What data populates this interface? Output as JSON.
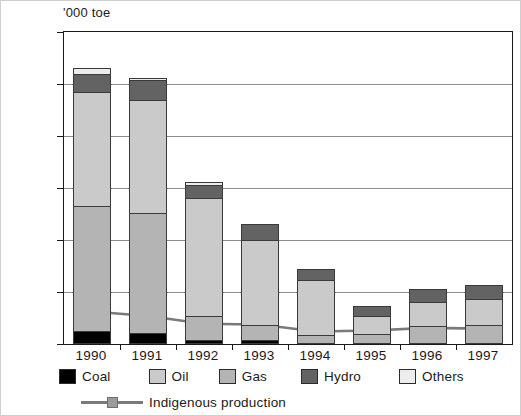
{
  "axis": {
    "unit_label": "'000 toe",
    "y_ticks": [
      "0",
      "2 000",
      "4 000",
      "6 000",
      "8 000",
      "10 000",
      "12 000"
    ]
  },
  "legend": {
    "items": [
      {
        "label": "Coal",
        "color": "#000000"
      },
      {
        "label": "Oil",
        "color": "#cacaca"
      },
      {
        "label": "Gas",
        "color": "#b4b4b4"
      },
      {
        "label": "Hydro",
        "color": "#636363"
      },
      {
        "label": "Others",
        "color": "#ededed"
      }
    ],
    "line_series_label": "Indigenous production",
    "line_color": "#7a7a7a",
    "marker_color": "#9b9b9b"
  },
  "chart_data": {
    "type": "bar",
    "subtype": "stacked-bar-with-line-overlay",
    "title": "",
    "xlabel": "",
    "ylabel": "'000 toe",
    "ylim": [
      0,
      12000
    ],
    "ytick_step": 2000,
    "grid": true,
    "legend_position": "bottom",
    "categories": [
      "1990",
      "1991",
      "1992",
      "1993",
      "1994",
      "1995",
      "1996",
      "1997"
    ],
    "series": [
      {
        "name": "Coal",
        "color": "#000000",
        "values": [
          500,
          420,
          170,
          150,
          0,
          0,
          0,
          0
        ]
      },
      {
        "name": "Gas",
        "color": "#b4b4b4",
        "values": [
          4800,
          4630,
          900,
          600,
          330,
          380,
          700,
          750
        ]
      },
      {
        "name": "Oil",
        "color": "#cacaca",
        "values": [
          4400,
          4350,
          4550,
          3250,
          2150,
          700,
          900,
          1000
        ]
      },
      {
        "name": "Hydro",
        "color": "#636363",
        "values": [
          700,
          750,
          500,
          600,
          400,
          400,
          530,
          530
        ]
      },
      {
        "name": "Others",
        "color": "#ededed",
        "values": [
          200,
          100,
          100,
          0,
          0,
          0,
          0,
          0
        ]
      }
    ],
    "totals": [
      10600,
      10250,
      6220,
      4600,
      2880,
      1480,
      2130,
      2280
    ],
    "line_series": {
      "name": "Indigenous production",
      "color": "#7a7a7a",
      "marker": "square",
      "values": [
        1250,
        1080,
        780,
        750,
        480,
        520,
        620,
        590
      ]
    }
  }
}
